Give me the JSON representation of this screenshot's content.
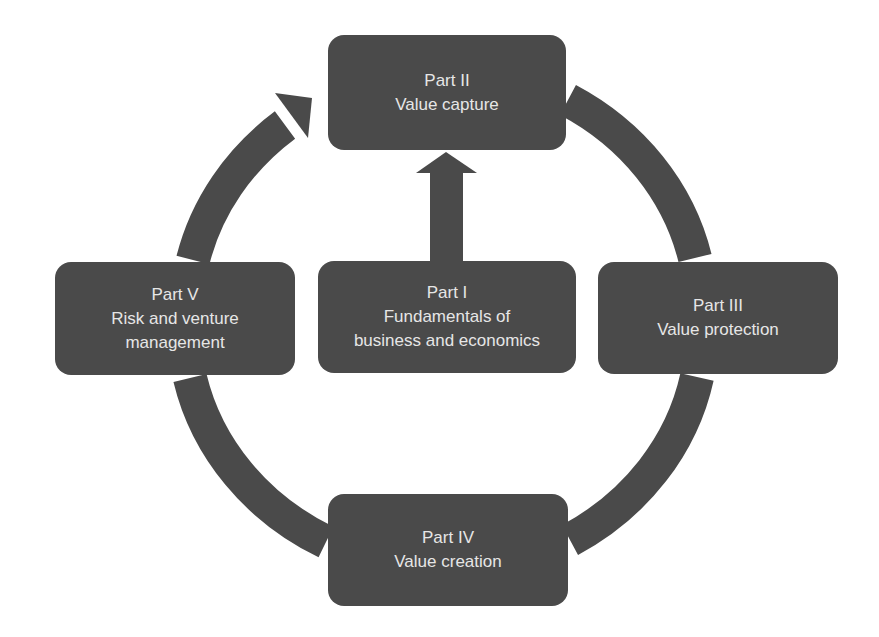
{
  "diagram": {
    "type": "cycle",
    "colors": {
      "box": "#4a4a4a",
      "text": "#e6e6e6",
      "arrow": "#4a4a4a",
      "background": "#ffffff"
    },
    "nodes": [
      {
        "id": "part2",
        "title": "Part II",
        "lines": [
          "Value capture"
        ]
      },
      {
        "id": "part3",
        "title": "Part III",
        "lines": [
          "Value protection"
        ]
      },
      {
        "id": "part4",
        "title": "Part IV",
        "lines": [
          "Value creation"
        ]
      },
      {
        "id": "part5",
        "title": "Part V",
        "lines": [
          "Risk and venture",
          "management"
        ]
      },
      {
        "id": "part1",
        "title": "Part I",
        "lines": [
          "Fundamentals of",
          "business and economics"
        ]
      }
    ],
    "edges": [
      {
        "from": "part2",
        "to": "part3",
        "style": "arc"
      },
      {
        "from": "part3",
        "to": "part4",
        "style": "arc"
      },
      {
        "from": "part4",
        "to": "part5",
        "style": "arc"
      },
      {
        "from": "part5",
        "to": "part2",
        "style": "arc-arrow"
      },
      {
        "from": "part1",
        "to": "part2",
        "style": "straight-arrow"
      }
    ]
  }
}
